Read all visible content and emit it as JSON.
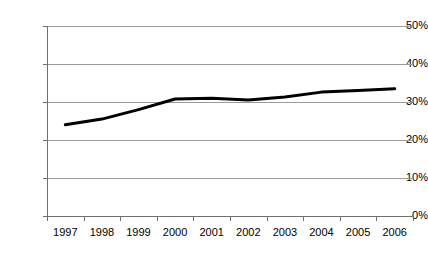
{
  "chart_data": {
    "type": "line",
    "title": "",
    "subtitle": "",
    "xlabel": "",
    "ylabel": "",
    "categories": [
      "1997",
      "1998",
      "1999",
      "2000",
      "2001",
      "2002",
      "2003",
      "2004",
      "2005",
      "2006"
    ],
    "series": [
      {
        "name": "",
        "values": [
          24.0,
          25.5,
          28.0,
          30.8,
          31.0,
          30.5,
          31.3,
          32.6,
          33.0,
          33.5
        ],
        "color": "#000000",
        "line_width": 3,
        "markers": false
      }
    ],
    "ylim": [
      0,
      50
    ],
    "ytick_values": [
      0,
      10,
      20,
      30,
      40,
      50
    ],
    "ytick_labels": [
      "0%",
      "10%",
      "20%",
      "30%",
      "40%",
      "50%"
    ],
    "grid": true,
    "grid_axis": "y",
    "grid_color": "#9a9a9a",
    "axis_color": "#6f6f6f",
    "legend": false,
    "legend_position": "none",
    "background": "#ffffff",
    "annotations": []
  }
}
